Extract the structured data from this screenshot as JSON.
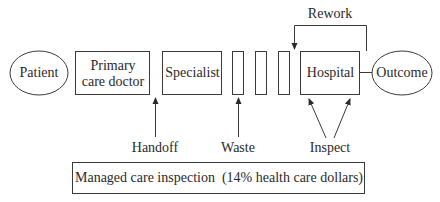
{
  "diagram": {
    "nodes": {
      "patient": {
        "label": "Patient",
        "shape": "ellipse"
      },
      "primary_care": {
        "label": "Primary care doctor",
        "line1": "Primary",
        "line2": "care doctor",
        "shape": "rect"
      },
      "specialist": {
        "label": "Specialist",
        "shape": "rect"
      },
      "waste_blocks": [
        {
          "shape": "rect"
        },
        {
          "shape": "rect"
        },
        {
          "shape": "rect"
        }
      ],
      "hospital": {
        "label": "Hospital",
        "shape": "rect"
      },
      "outcome": {
        "label": "Outcome",
        "shape": "ellipse"
      }
    },
    "annotations": {
      "rework": "Rework",
      "handoff": "Handoff",
      "waste": "Waste",
      "inspect": "Inspect"
    },
    "footer_box": {
      "label": "Managed care inspection  (14% health care dollars)"
    },
    "colors": {
      "stroke": "#3a3a3a",
      "text": "#2a2a2a",
      "background": "#ffffff"
    }
  }
}
